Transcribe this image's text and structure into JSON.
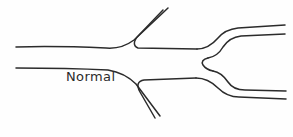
{
  "figure": {
    "background_color": "#fefefe",
    "stroke_color": "#2b2b2b",
    "stroke_width": 1.5,
    "width": 293,
    "height": 137
  },
  "labels": {
    "normal": "Normal"
  },
  "diagram": {
    "paths": {
      "trunk_upper_wall": "M 16,47 C 48,46 82,47 106,48 C 118,49 126,46 134,40 L 168,8",
      "ascending_branch_inner": "M 163,10 L 139,35 C 133,41 133,46 138,48 L 197,49",
      "trunk_lower_wall": "M 16,68 C 54,68 88,69 108,70 C 120,72 128,76 136,84 L 160,116",
      "descending_branch_inner": "M 155,118 L 140,92 C 136,85 138,81 144,80 L 196,78",
      "upper_fork_outer": "M 197,49 C 206,49 212,45 218,38 C 223,32 229,29 238,28 L 285,25",
      "upper_fork_inner": "M 285,34 L 241,36 C 232,37 227,41 223,47 C 219,54 214,57 208,58",
      "fork_crotch": "M 208,58 C 203,59 201,62 203,65 C 205,68 208,70 213,71",
      "lower_fork_inner": "M 213,71 C 219,72 224,76 228,82 C 232,88 237,90 245,90 L 286,91",
      "lower_fork_outer": "M 196,78 C 205,78 212,82 218,88 C 224,94 230,97 239,97 L 286,99"
    }
  }
}
